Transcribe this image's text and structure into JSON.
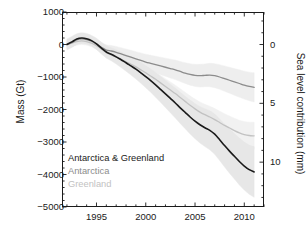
{
  "chart_data": {
    "type": "line",
    "title": "",
    "xlabel": "",
    "ylabel": "Mass (Gt)",
    "y2label": "Sea level contribution (mm)",
    "xlim": [
      1991.5,
      2012.0
    ],
    "ylim": [
      -5000,
      1000
    ],
    "y2lim": [
      13.8,
      -2.76
    ],
    "grid": false,
    "legend_position": "lower-left",
    "xticks": [
      1995,
      2000,
      2005,
      2010
    ],
    "xtick_labels": [
      "1995",
      "2000",
      "2005",
      "2010"
    ],
    "x_minor_tick_interval": 1,
    "yticks": [
      1000,
      0,
      -1000,
      -2000,
      -3000,
      -4000,
      -5000
    ],
    "ytick_labels": [
      "1000",
      "0",
      "-1000",
      "-2000",
      "-3000",
      "-4000",
      "-5000"
    ],
    "y2ticks": [
      0,
      5,
      10
    ],
    "y2tick_labels": [
      "0",
      "5",
      "10"
    ],
    "y_minor_tick_interval": 200,
    "conversion_note": "1 mm sea level = -362 Gt mass",
    "x": [
      1992.0,
      1992.5,
      1993.0,
      1993.5,
      1994.0,
      1994.5,
      1995.0,
      1995.5,
      1996.0,
      1996.5,
      1997.0,
      1997.5,
      1998.0,
      1998.5,
      1999.0,
      1999.5,
      2000.0,
      2000.5,
      2001.0,
      2001.5,
      2002.0,
      2002.5,
      2003.0,
      2003.5,
      2004.0,
      2004.5,
      2005.0,
      2005.5,
      2006.0,
      2006.5,
      2007.0,
      2007.5,
      2008.0,
      2008.5,
      2009.0,
      2009.5,
      2010.0,
      2010.5,
      2011.0
    ],
    "series": [
      {
        "name": "Antarctica & Greenland",
        "color": "#1a1a1a",
        "width": 1.6,
        "band_color": "#e6e6e6",
        "values": [
          0,
          80,
          170,
          200,
          180,
          120,
          20,
          -110,
          -230,
          -300,
          -380,
          -470,
          -560,
          -660,
          -760,
          -870,
          -990,
          -1110,
          -1240,
          -1380,
          -1520,
          -1660,
          -1800,
          -1950,
          -2090,
          -2230,
          -2360,
          -2470,
          -2560,
          -2640,
          -2760,
          -2930,
          -3110,
          -3280,
          -3440,
          -3600,
          -3740,
          -3850,
          -3920
        ],
        "band_upper": [
          170,
          250,
          330,
          360,
          340,
          280,
          190,
          70,
          -40,
          -100,
          -160,
          -230,
          -300,
          -380,
          -460,
          -550,
          -650,
          -750,
          -860,
          -980,
          -1100,
          -1220,
          -1340,
          -1470,
          -1590,
          -1710,
          -1820,
          -1910,
          -1980,
          -2040,
          -2140,
          -2290,
          -2450,
          -2600,
          -2740,
          -2880,
          -3000,
          -3090,
          -3140
        ],
        "band_lower": [
          -170,
          -90,
          10,
          40,
          20,
          -40,
          -150,
          -290,
          -420,
          -500,
          -600,
          -710,
          -820,
          -940,
          -1060,
          -1190,
          -1330,
          -1470,
          -1620,
          -1780,
          -1940,
          -2100,
          -2260,
          -2430,
          -2590,
          -2750,
          -2900,
          -3030,
          -3140,
          -3240,
          -3380,
          -3570,
          -3770,
          -3960,
          -4140,
          -4320,
          -4480,
          -4610,
          -4700
        ]
      },
      {
        "name": "Antarctica",
        "color": "#8c8c8c",
        "width": 1.3,
        "band_color": "#ededed",
        "values": [
          0,
          60,
          140,
          170,
          150,
          100,
          20,
          -90,
          -170,
          -200,
          -240,
          -290,
          -340,
          -390,
          -440,
          -490,
          -540,
          -580,
          -620,
          -660,
          -700,
          -740,
          -780,
          -830,
          -880,
          -920,
          -950,
          -960,
          -950,
          -940,
          -960,
          -1000,
          -1050,
          -1100,
          -1150,
          -1200,
          -1250,
          -1290,
          -1320
        ],
        "band_upper": [
          130,
          200,
          280,
          310,
          290,
          240,
          160,
          60,
          -10,
          -30,
          -60,
          -100,
          -140,
          -180,
          -220,
          -260,
          -300,
          -330,
          -360,
          -390,
          -420,
          -450,
          -480,
          -520,
          -560,
          -590,
          -610,
          -610,
          -600,
          -580,
          -590,
          -620,
          -660,
          -700,
          -740,
          -780,
          -820,
          -850,
          -870
        ],
        "band_lower": [
          -130,
          -70,
          0,
          30,
          10,
          -40,
          -120,
          -240,
          -330,
          -370,
          -420,
          -480,
          -540,
          -600,
          -660,
          -720,
          -780,
          -830,
          -880,
          -930,
          -980,
          -1030,
          -1080,
          -1140,
          -1200,
          -1250,
          -1290,
          -1310,
          -1300,
          -1300,
          -1330,
          -1380,
          -1440,
          -1500,
          -1560,
          -1620,
          -1680,
          -1730,
          -1770
        ]
      },
      {
        "name": "Greenland",
        "color": "#c2c2c2",
        "width": 1.3,
        "band_color": "#f0f0f0",
        "values": [
          0,
          40,
          90,
          110,
          90,
          40,
          -40,
          -140,
          -250,
          -320,
          -390,
          -460,
          -530,
          -610,
          -690,
          -780,
          -870,
          -970,
          -1070,
          -1180,
          -1290,
          -1400,
          -1510,
          -1630,
          -1750,
          -1870,
          -1980,
          -2080,
          -2160,
          -2230,
          -2310,
          -2400,
          -2490,
          -2570,
          -2650,
          -2720,
          -2770,
          -2800,
          -2810
        ],
        "band_upper": [
          110,
          150,
          200,
          220,
          200,
          150,
          70,
          -30,
          -130,
          -190,
          -250,
          -310,
          -370,
          -440,
          -510,
          -590,
          -670,
          -760,
          -850,
          -950,
          -1050,
          -1150,
          -1250,
          -1360,
          -1470,
          -1580,
          -1680,
          -1770,
          -1840,
          -1900,
          -1970,
          -2050,
          -2130,
          -2200,
          -2270,
          -2330,
          -2370,
          -2390,
          -2390
        ],
        "band_lower": [
          -110,
          -70,
          -20,
          0,
          -20,
          -70,
          -150,
          -250,
          -370,
          -450,
          -530,
          -610,
          -690,
          -780,
          -870,
          -970,
          -1070,
          -1180,
          -1290,
          -1410,
          -1530,
          -1650,
          -1770,
          -1900,
          -2030,
          -2160,
          -2280,
          -2390,
          -2480,
          -2560,
          -2650,
          -2750,
          -2850,
          -2940,
          -3030,
          -3110,
          -3170,
          -3210,
          -3230
        ]
      }
    ],
    "legend": [
      {
        "label": "Antarctica & Greenland",
        "color": "#1a1a1a"
      },
      {
        "label": "Antarctica",
        "color": "#8c8c8c"
      },
      {
        "label": "Greenland",
        "color": "#c2c2c2"
      }
    ]
  }
}
